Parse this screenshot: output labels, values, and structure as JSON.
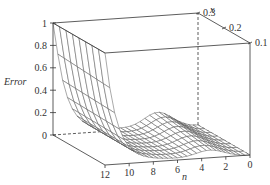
{
  "chart_data": {
    "type": "surface3d",
    "title": "",
    "zlabel": "Error",
    "xlabel": "n",
    "ylabel": "x",
    "zlim": [
      0,
      1
    ],
    "n_range": [
      0,
      12
    ],
    "x_range": [
      0.1,
      0.3
    ],
    "z_ticks": [
      "0",
      "0.2",
      "0.4",
      "0.6",
      "0.8",
      "1"
    ],
    "z_tick_values": [
      0,
      0.2,
      0.4,
      0.6,
      0.8,
      1
    ],
    "n_ticks": [
      "12",
      "10",
      "8",
      "6",
      "4",
      "2",
      "0"
    ],
    "n_tick_values": [
      12,
      10,
      8,
      6,
      4,
      2,
      0
    ],
    "x_ticks": [
      "0.3",
      "0.2",
      "0.1"
    ],
    "x_tick_values": [
      0.3,
      0.2,
      0.1
    ],
    "grid": false,
    "surface_samples": {
      "n": [
        12,
        11,
        10,
        9,
        8,
        6,
        4,
        3,
        2,
        0
      ],
      "x": [
        0.1,
        0.2,
        0.3
      ],
      "error_x_0.1": [
        0.95,
        0.35,
        0.12,
        0.05,
        0.03,
        0.03,
        0.05,
        0.06,
        0.04,
        0.0
      ],
      "error_x_0.2": [
        0.97,
        0.4,
        0.14,
        0.06,
        0.04,
        0.05,
        0.08,
        0.09,
        0.05,
        0.0
      ],
      "error_x_0.3": [
        1.0,
        0.45,
        0.16,
        0.07,
        0.05,
        0.07,
        0.12,
        0.13,
        0.06,
        0.0
      ]
    }
  }
}
